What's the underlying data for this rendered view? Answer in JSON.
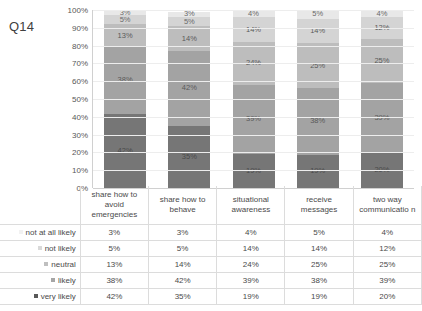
{
  "chart_title": "Q14",
  "chart_data": {
    "type": "bar",
    "subtype": "stacked-100-percent",
    "title": "Q14",
    "xlabel": "",
    "ylabel": "",
    "ylim": [
      0,
      100
    ],
    "grid": true,
    "legend_position": "table-left",
    "ytick_labels": [
      "100%",
      "90%",
      "80%",
      "70%",
      "60%",
      "50%",
      "40%",
      "30%",
      "20%",
      "10%",
      "0%"
    ],
    "ytick_values": [
      100,
      90,
      80,
      70,
      60,
      50,
      40,
      30,
      20,
      10,
      0
    ],
    "categories": [
      "share how to avoid emergencies",
      "share how to behave",
      "situational awareness",
      "receive messages",
      "two way communicatio n"
    ],
    "series": [
      {
        "name": "not at all likely",
        "values": [
          3,
          3,
          4,
          5,
          4
        ],
        "color": "#e8e8e8",
        "labels": [
          "3%",
          "3%",
          "4%",
          "5%",
          "4%"
        ]
      },
      {
        "name": "not likely",
        "values": [
          5,
          5,
          14,
          14,
          12
        ],
        "color": "#d4d4d4",
        "labels": [
          "5%",
          "5%",
          "14%",
          "14%",
          "12%"
        ]
      },
      {
        "name": "neutral",
        "values": [
          13,
          14,
          24,
          25,
          25
        ],
        "color": "#bdbdbd",
        "labels": [
          "13%",
          "14%",
          "24%",
          "25%",
          "25%"
        ]
      },
      {
        "name": "likely",
        "values": [
          38,
          42,
          39,
          38,
          39
        ],
        "color": "#a3a3a3",
        "labels": [
          "38%",
          "42%",
          "39%",
          "38%",
          "39%"
        ]
      },
      {
        "name": "very likely",
        "values": [
          42,
          35,
          19,
          19,
          20
        ],
        "color": "#767676",
        "labels": [
          "42%",
          "35%",
          "19%",
          "19%",
          "20%"
        ]
      }
    ]
  },
  "table": {
    "category_headers": [
      "share how to avoid emergencies",
      "share how to behave",
      "situational awareness",
      "receive messages",
      "two way communicatio n"
    ],
    "rows": [
      {
        "label": "not at all likely",
        "swatch": "#f2f2f2",
        "values": [
          "3%",
          "3%",
          "4%",
          "5%",
          "4%"
        ]
      },
      {
        "label": "not likely",
        "swatch": "#d9d9d9",
        "values": [
          "5%",
          "5%",
          "14%",
          "14%",
          "12%"
        ]
      },
      {
        "label": "neutral",
        "swatch": "#bfbfbf",
        "values": [
          "13%",
          "14%",
          "24%",
          "25%",
          "25%"
        ]
      },
      {
        "label": "likely",
        "swatch": "#a6a6a6",
        "values": [
          "38%",
          "42%",
          "39%",
          "38%",
          "39%"
        ]
      },
      {
        "label": "very likely",
        "swatch": "#595959",
        "values": [
          "42%",
          "35%",
          "19%",
          "19%",
          "20%"
        ]
      }
    ]
  }
}
